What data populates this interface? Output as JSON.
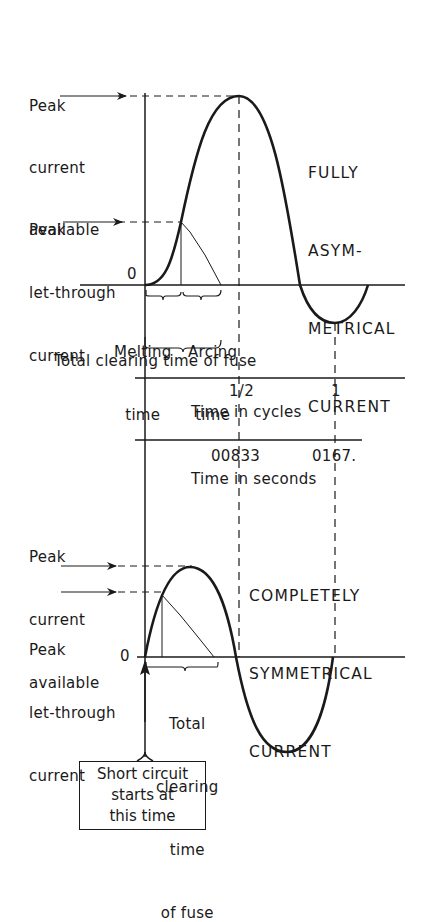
{
  "top_panel": {
    "title_lines": [
      "FULLY",
      "ASYM-",
      "METRICAL",
      "CURRENT"
    ],
    "peak_available_label": [
      "Peak",
      "current",
      "available"
    ],
    "peak_letthrough_label": [
      "Peak",
      "let-through",
      "current"
    ],
    "zero_label": "0",
    "melting_time_label": [
      "Melting",
      "time"
    ],
    "arcing_time_label": [
      "Arcing",
      "time"
    ],
    "total_clearing_label": "Total clearing time of fuse"
  },
  "axes": {
    "cycles_ticks": [
      "1/2",
      "1"
    ],
    "cycles_label": "Time in cycles",
    "seconds_ticks": [
      "00833",
      "0167."
    ],
    "seconds_label": "Time in seconds"
  },
  "bottom_panel": {
    "title_lines": [
      "COMPLETELY",
      "SYMMETRICAL",
      "CURRENT"
    ],
    "peak_available_label": [
      "Peak",
      "current",
      "available"
    ],
    "peak_letthrough_label": [
      "Peak",
      "let-through",
      "current"
    ],
    "zero_label": "0",
    "total_clearing_label": [
      "Total",
      "clearing",
      "time",
      "of fuse"
    ],
    "start_box_label": [
      "Short circuit",
      "starts at",
      "this time"
    ]
  },
  "colors": {
    "ink": "#1a1a1a",
    "background": "#ffffff"
  }
}
